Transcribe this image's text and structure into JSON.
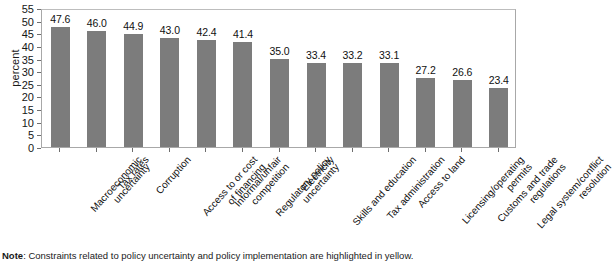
{
  "chart_data": {
    "type": "bar",
    "title": "",
    "subtitle": "",
    "xlabel": "",
    "ylabel": "percent",
    "ylim": [
      0,
      55
    ],
    "ytick_step": 5,
    "yticks": [
      "55",
      "50",
      "45",
      "40",
      "35",
      "30",
      "25",
      "20",
      "15",
      "10",
      "5",
      "0"
    ],
    "grid": false,
    "legend": "none",
    "orientation": "vertical",
    "bar_color": "#7c7c7c",
    "categories": [
      "Macroeconomic uncertainty",
      "Tax rates",
      "Corruption",
      "Access to or cost of financing",
      "Informal/unfair competition",
      "Regulatory policy uncertainty",
      "Electricity",
      "Skills and education",
      "Tax administration",
      "Access to land",
      "Licensing/operating permits",
      "Customs and trade regulations",
      "Legal system/conflict resolution"
    ],
    "category_lines": [
      [
        "Macroeconomic",
        "uncertainty"
      ],
      [
        "Tax rates"
      ],
      [
        "Corruption"
      ],
      [
        "Access to or cost",
        "of financing"
      ],
      [
        "Informal/unfair",
        "competition"
      ],
      [
        "Regulatory policy",
        "uncertainty"
      ],
      [
        "Electricity"
      ],
      [
        "Skills and education"
      ],
      [
        "Tax administration"
      ],
      [
        "Access to land"
      ],
      [
        "Licensing/operating",
        "permits"
      ],
      [
        "Customs and trade",
        "regulations"
      ],
      [
        "Legal system/conflict",
        "resolution"
      ]
    ],
    "values": [
      47.6,
      46.0,
      44.9,
      43.0,
      42.4,
      41.4,
      35.0,
      33.4,
      33.2,
      33.1,
      27.2,
      26.6,
      23.4
    ],
    "value_labels": [
      "47.6",
      "46.0",
      "44.9",
      "43.0",
      "42.4",
      "41.4",
      "35.0",
      "33.4",
      "33.2",
      "33.1",
      "27.2",
      "26.6",
      "23.4"
    ]
  },
  "note": {
    "prefix": "Note",
    "text": ": Constraints related to policy uncertainty and policy implementation are highlighted in yellow."
  }
}
